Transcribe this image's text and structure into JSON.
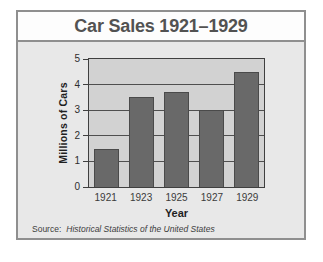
{
  "page": {
    "title": "Car Sales 1921–1929",
    "source_prefix": "Source:",
    "source_text": "Historical Statistics of the United States"
  },
  "chart_data": {
    "type": "bar",
    "title": "Car Sales 1921–1929",
    "categories": [
      "1921",
      "1923",
      "1925",
      "1927",
      "1929"
    ],
    "values": [
      1.5,
      3.5,
      3.7,
      3.0,
      4.5
    ],
    "xlabel": "Year",
    "ylabel": "Millions of Cars",
    "ylim": [
      0,
      5
    ],
    "yticks": [
      0,
      1,
      2,
      3,
      4,
      5
    ],
    "grid": "horizontal",
    "legend": "none",
    "colors": {
      "card_bg": "#e8e8e8",
      "card_border": "#8f8f8f",
      "banner_bg": "#fdfdfd",
      "title_color": "#525252",
      "plot_bg": "#d2d2d2",
      "plot_border": "#3f3f3f",
      "gridline": "#4f4f4f",
      "bar_fill": "#696969",
      "bar_border": "#4a4a4a"
    }
  }
}
